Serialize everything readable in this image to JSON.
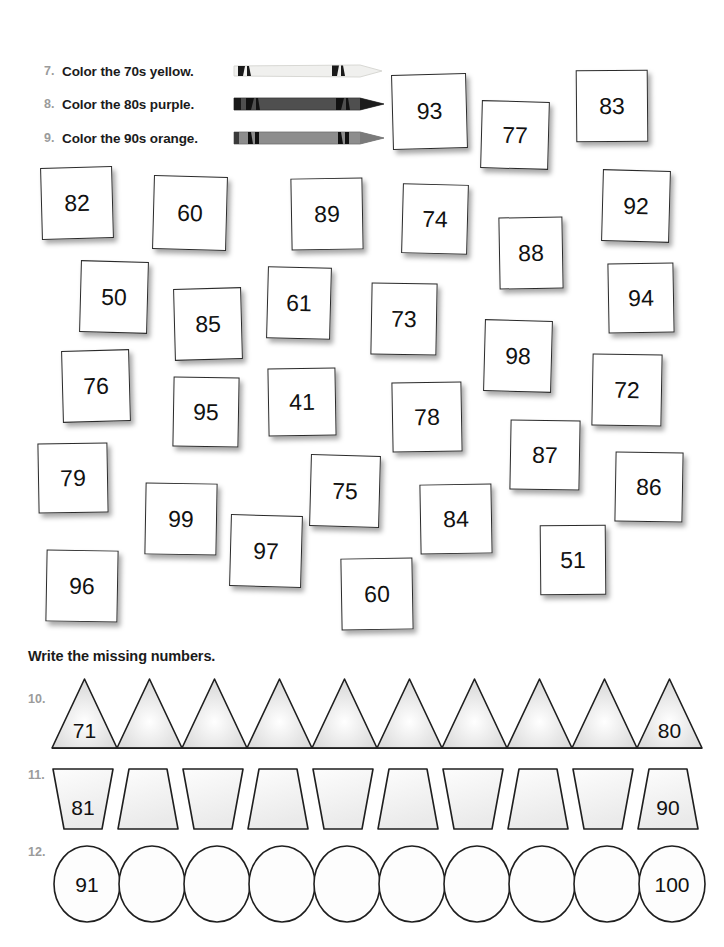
{
  "worksheet": {
    "instructions": [
      {
        "num": "7.",
        "text": "Color the 70s yellow.",
        "crayon": "crayon-yellow",
        "crayon_color": "#f2f2f0"
      },
      {
        "num": "8.",
        "text": "Color the 80s purple.",
        "crayon": "crayon-purple",
        "crayon_color": "#4d4d4d"
      },
      {
        "num": "9.",
        "text": "Color the 90s orange.",
        "crayon": "crayon-orange",
        "crayon_color": "#8a8a8a"
      }
    ],
    "number_cards": [
      {
        "value": "93",
        "x": 392,
        "y": 74,
        "w": 75,
        "h": 75,
        "rot": -1.5
      },
      {
        "value": "77",
        "x": 481,
        "y": 101,
        "w": 68,
        "h": 68,
        "rot": 1.5
      },
      {
        "value": "83",
        "x": 576,
        "y": 70,
        "w": 72,
        "h": 72,
        "rot": -0.5
      },
      {
        "value": "82",
        "x": 41,
        "y": 167,
        "w": 72,
        "h": 72,
        "rot": -1.5
      },
      {
        "value": "60",
        "x": 153,
        "y": 176,
        "w": 74,
        "h": 74,
        "rot": 1.5
      },
      {
        "value": "89",
        "x": 291,
        "y": 178,
        "w": 72,
        "h": 72,
        "rot": -1
      },
      {
        "value": "74",
        "x": 402,
        "y": 184,
        "w": 66,
        "h": 70,
        "rot": 1.5
      },
      {
        "value": "88",
        "x": 499,
        "y": 217,
        "w": 64,
        "h": 72,
        "rot": -1
      },
      {
        "value": "92",
        "x": 602,
        "y": 170,
        "w": 68,
        "h": 72,
        "rot": 1.5
      },
      {
        "value": "50",
        "x": 80,
        "y": 261,
        "w": 68,
        "h": 72,
        "rot": 1.5
      },
      {
        "value": "85",
        "x": 174,
        "y": 288,
        "w": 68,
        "h": 72,
        "rot": -1.5
      },
      {
        "value": "61",
        "x": 267,
        "y": 267,
        "w": 64,
        "h": 72,
        "rot": 1.5
      },
      {
        "value": "73",
        "x": 371,
        "y": 283,
        "w": 66,
        "h": 72,
        "rot": 1
      },
      {
        "value": "94",
        "x": 608,
        "y": 263,
        "w": 66,
        "h": 70,
        "rot": -1
      },
      {
        "value": "98",
        "x": 484,
        "y": 320,
        "w": 68,
        "h": 72,
        "rot": 1.5
      },
      {
        "value": "76",
        "x": 62,
        "y": 350,
        "w": 68,
        "h": 72,
        "rot": -1.5
      },
      {
        "value": "95",
        "x": 173,
        "y": 377,
        "w": 66,
        "h": 70,
        "rot": 1
      },
      {
        "value": "41",
        "x": 268,
        "y": 368,
        "w": 68,
        "h": 68,
        "rot": -1
      },
      {
        "value": "78",
        "x": 392,
        "y": 382,
        "w": 70,
        "h": 70,
        "rot": -1
      },
      {
        "value": "72",
        "x": 592,
        "y": 354,
        "w": 70,
        "h": 72,
        "rot": 1
      },
      {
        "value": "87",
        "x": 510,
        "y": 420,
        "w": 70,
        "h": 70,
        "rot": 1
      },
      {
        "value": "79",
        "x": 38,
        "y": 443,
        "w": 70,
        "h": 70,
        "rot": -1
      },
      {
        "value": "86",
        "x": 615,
        "y": 452,
        "w": 68,
        "h": 70,
        "rot": 1
      },
      {
        "value": "75",
        "x": 310,
        "y": 455,
        "w": 70,
        "h": 72,
        "rot": 1.5
      },
      {
        "value": "99",
        "x": 145,
        "y": 483,
        "w": 72,
        "h": 72,
        "rot": 1
      },
      {
        "value": "84",
        "x": 420,
        "y": 484,
        "w": 72,
        "h": 70,
        "rot": -1
      },
      {
        "value": "97",
        "x": 230,
        "y": 515,
        "w": 72,
        "h": 72,
        "rot": 1.5
      },
      {
        "value": "51",
        "x": 540,
        "y": 525,
        "w": 66,
        "h": 70,
        "rot": -0.5
      },
      {
        "value": "96",
        "x": 46,
        "y": 550,
        "w": 72,
        "h": 72,
        "rot": 1
      },
      {
        "value": "60",
        "x": 341,
        "y": 558,
        "w": 72,
        "h": 72,
        "rot": -1
      }
    ],
    "missing_heading": "Write the missing numbers.",
    "shape_rows": [
      {
        "num": "10.",
        "shape": "triangle",
        "count": 10,
        "labels": [
          "71",
          "",
          "",
          "",
          "",
          "",
          "",
          "",
          "",
          "80"
        ]
      },
      {
        "num": "11.",
        "shape": "trapezoid",
        "count": 10,
        "labels": [
          "81",
          "",
          "",
          "",
          "",
          "",
          "",
          "",
          "",
          "90"
        ]
      },
      {
        "num": "12.",
        "shape": "ellipse",
        "count": 10,
        "labels": [
          "91",
          "",
          "",
          "",
          "",
          "",
          "",
          "",
          "",
          "100"
        ]
      }
    ]
  }
}
